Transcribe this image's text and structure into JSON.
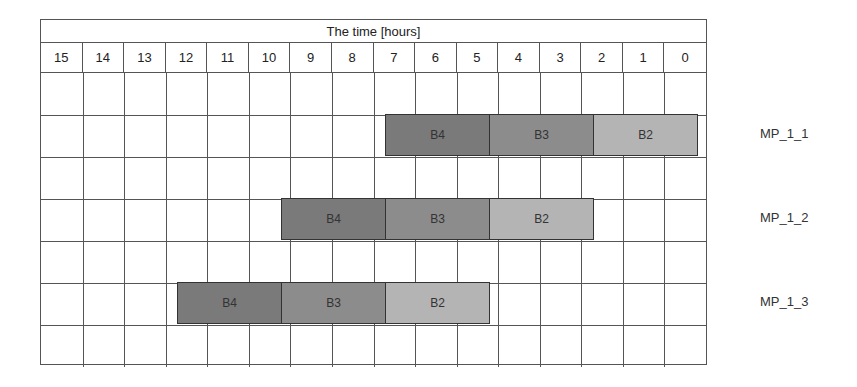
{
  "chart_data": {
    "type": "gantt",
    "title": "The time [hours]",
    "x_axis": {
      "label": "The time [hours]",
      "ticks": [
        "15",
        "14",
        "13",
        "12",
        "11",
        "10",
        "9",
        "8",
        "7",
        "6",
        "5",
        "4",
        "3",
        "2",
        "1",
        "0"
      ],
      "direction": "descending left-to-right"
    },
    "rows": [
      {
        "label": "",
        "blocks": []
      },
      {
        "label": "MP_1_1",
        "blocks": [
          {
            "name": "B4",
            "start": 6.75,
            "end": 4.25,
            "color": "#7a7a7a"
          },
          {
            "name": "B3",
            "start": 4.25,
            "end": 1.75,
            "color": "#8c8c8c"
          },
          {
            "name": "B2",
            "start": 1.75,
            "end": -0.75,
            "color": "#b4b4b4"
          }
        ]
      },
      {
        "label": "",
        "blocks": []
      },
      {
        "label": "MP_1_2",
        "blocks": [
          {
            "name": "B4",
            "start": 9.25,
            "end": 6.75,
            "color": "#7a7a7a"
          },
          {
            "name": "B3",
            "start": 6.75,
            "end": 4.25,
            "color": "#8c8c8c"
          },
          {
            "name": "B2",
            "start": 4.25,
            "end": 1.75,
            "color": "#b4b4b4"
          }
        ]
      },
      {
        "label": "",
        "blocks": []
      },
      {
        "label": "MP_1_3",
        "blocks": [
          {
            "name": "B4",
            "start": 11.75,
            "end": 9.25,
            "color": "#7a7a7a"
          },
          {
            "name": "B3",
            "start": 9.25,
            "end": 6.75,
            "color": "#8c8c8c"
          },
          {
            "name": "B2",
            "start": 6.75,
            "end": 4.25,
            "color": "#b4b4b4"
          }
        ]
      },
      {
        "label": "",
        "blocks": []
      }
    ],
    "series_labels": [
      "MP_1_1",
      "MP_1_2",
      "MP_1_3"
    ],
    "block_labels": [
      "B4",
      "B3",
      "B2"
    ],
    "colors": {
      "B4": "#7a7a7a",
      "B3": "#8c8c8c",
      "B2": "#b4b4b4",
      "grid": "#555555"
    }
  },
  "header": {
    "title": "The time [hours]",
    "ticks": [
      "15",
      "14",
      "13",
      "12",
      "11",
      "10",
      "9",
      "8",
      "7",
      "6",
      "5",
      "4",
      "3",
      "2",
      "1",
      "0"
    ]
  },
  "rows": {
    "mp_1_1": {
      "label": "MP_1_1",
      "b4": "B4",
      "b3": "B3",
      "b2": "B2"
    },
    "mp_1_2": {
      "label": "MP_1_2",
      "b4": "B4",
      "b3": "B3",
      "b2": "B2"
    },
    "mp_1_3": {
      "label": "MP_1_3",
      "b4": "B4",
      "b3": "B3",
      "b2": "B2"
    }
  }
}
